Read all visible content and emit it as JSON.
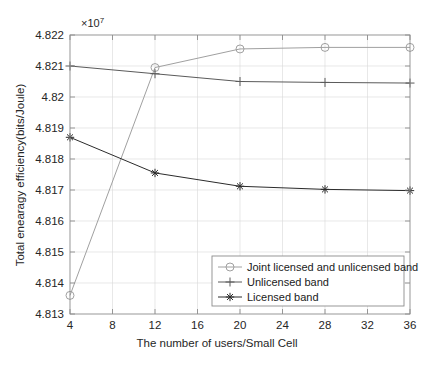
{
  "chart_data": {
    "type": "line",
    "title": "",
    "xlabel": "The number of users/Small Cell",
    "ylabel": "Total enearagy efficiency(bits/Joule)",
    "y_exponent_label": "×10",
    "y_exponent_power": "7",
    "y_scale": 10000000,
    "x": [
      4,
      12,
      20,
      28,
      36
    ],
    "xlim": [
      4,
      36
    ],
    "ylim": [
      4.813,
      4.822
    ],
    "xticks": [
      4,
      8,
      12,
      16,
      20,
      24,
      28,
      32,
      36
    ],
    "xticklabels": [
      "4",
      "8",
      "12",
      "16",
      "20",
      "24",
      "28",
      "32",
      "36"
    ],
    "yticks": [
      4.813,
      4.814,
      4.815,
      4.816,
      4.817,
      4.818,
      4.819,
      4.82,
      4.821,
      4.822
    ],
    "yticklabels": [
      "4.813",
      "4.814",
      "4.815",
      "4.816",
      "4.817",
      "4.818",
      "4.819",
      "4.82",
      "4.821",
      "4.822"
    ],
    "grid": true,
    "legend_position": "lower right",
    "series": [
      {
        "name": "Joint licensed and unlicensed band",
        "marker": "circle",
        "color": "#a0a0a0",
        "values": [
          4.8136,
          4.82095,
          4.82155,
          4.8216,
          4.8216
        ]
      },
      {
        "name": "Unlicensed band",
        "marker": "plus",
        "color": "#5a5a5a",
        "values": [
          4.821,
          4.82075,
          4.8205,
          4.82047,
          4.82045
        ]
      },
      {
        "name": "Licensed band",
        "marker": "asterisk",
        "color": "#2b2b2b",
        "values": [
          4.8187,
          4.81755,
          4.81712,
          4.81702,
          4.81698
        ]
      }
    ]
  },
  "colors": {
    "axis": "#8c8c8c",
    "grid": "#d9d9d9",
    "text": "#262626",
    "background": "#ffffff"
  }
}
